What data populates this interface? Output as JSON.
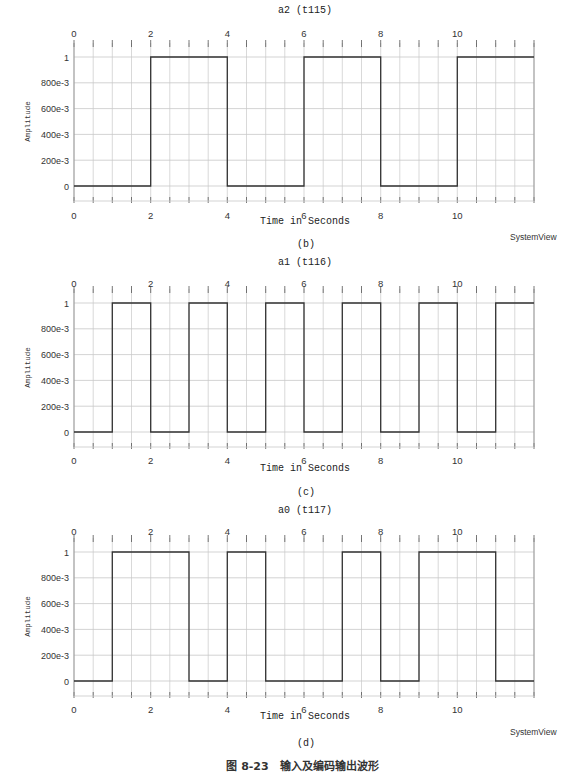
{
  "figure": {
    "caption": "图 8-23　输入及编码输出波形",
    "brand": "SystemView"
  },
  "chart_data": [
    {
      "type": "line",
      "subfigure": "(b)",
      "title": "a2 (t115)",
      "xlabel": "Time in Seconds",
      "ylabel": "Amplitude",
      "xlim": [
        0,
        12
      ],
      "ylim": [
        0,
        1
      ],
      "xticks": [
        "0",
        "2",
        "4",
        "6",
        "8",
        "10"
      ],
      "yticks": [
        "0",
        "200e-3",
        "400e-3",
        "600e-3",
        "800e-3",
        "1"
      ],
      "grid": true,
      "x": [
        0,
        2,
        2,
        4,
        4,
        6,
        6,
        8,
        8,
        10,
        10,
        12
      ],
      "y": [
        0,
        0,
        1,
        1,
        0,
        0,
        1,
        1,
        0,
        0,
        1,
        1
      ],
      "brand_visible": true
    },
    {
      "type": "line",
      "subfigure": "(c)",
      "title": "a1 (t116)",
      "xlabel": "Time in Seconds",
      "ylabel": "Amplitude",
      "xlim": [
        0,
        12
      ],
      "ylim": [
        0,
        1
      ],
      "xticks": [
        "0",
        "2",
        "4",
        "6",
        "8",
        "10"
      ],
      "yticks": [
        "0",
        "200e-3",
        "400e-3",
        "600e-3",
        "800e-3",
        "1"
      ],
      "grid": true,
      "x": [
        0,
        1,
        1,
        2,
        2,
        3,
        3,
        4,
        4,
        5,
        5,
        6,
        6,
        7,
        7,
        8,
        8,
        9,
        9,
        10,
        10,
        11,
        11,
        12
      ],
      "y": [
        0,
        0,
        1,
        1,
        0,
        0,
        1,
        1,
        0,
        0,
        1,
        1,
        0,
        0,
        1,
        1,
        0,
        0,
        1,
        1,
        0,
        0,
        1,
        1
      ],
      "brand_visible": false
    },
    {
      "type": "line",
      "subfigure": "(d)",
      "title": "a0 (t117)",
      "xlabel": "Time in Seconds",
      "ylabel": "Amplitude",
      "xlim": [
        0,
        12
      ],
      "ylim": [
        0,
        1
      ],
      "xticks": [
        "0",
        "2",
        "4",
        "6",
        "8",
        "10"
      ],
      "yticks": [
        "0",
        "200e-3",
        "400e-3",
        "600e-3",
        "800e-3",
        "1"
      ],
      "grid": true,
      "x": [
        0,
        1,
        1,
        3,
        3,
        4,
        4,
        5,
        5,
        7,
        7,
        8,
        8,
        9,
        9,
        11,
        11,
        12
      ],
      "y": [
        0,
        0,
        1,
        1,
        0,
        0,
        1,
        1,
        0,
        0,
        1,
        1,
        0,
        0,
        1,
        1,
        0,
        0
      ],
      "brand_visible": true
    }
  ],
  "layout_colors": {
    "grid": "#c8c8c8",
    "axis": "#9a9a9a",
    "trace": "#333333"
  }
}
